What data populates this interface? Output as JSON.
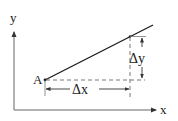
{
  "diagram": {
    "title": "",
    "labels": {
      "y_axis": "y",
      "x_axis": "x",
      "point": "A",
      "delta_x": "Δx",
      "delta_y": "Δy"
    },
    "colors": {
      "line": "#1a1a1a",
      "axis": "#555555",
      "dashed": "#555555",
      "background": "#ffffff"
    }
  }
}
